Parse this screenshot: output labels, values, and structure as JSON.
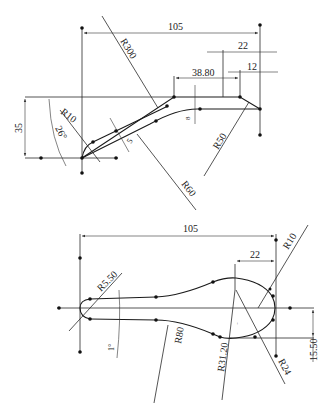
{
  "figure": {
    "type": "cad-sketch",
    "views": 2,
    "caption": "",
    "line_color": "#1a1a1a",
    "background": "#ffffff"
  },
  "top_view": {
    "dimensions": {
      "overall_length": "105",
      "right_offset_upper": "22",
      "right_offset_lower": "12",
      "flat_length": "38.80",
      "height": "35",
      "angle": "26°",
      "thickness_step": "8",
      "wall_thickness": "5",
      "radius_large": "R300",
      "radius_corner": "R10",
      "radius_lower_arc": "R60",
      "radius_right": "R50"
    }
  },
  "bottom_view": {
    "dimensions": {
      "overall_length": "105",
      "head_offset": "22",
      "radius_tip": "R10",
      "radius_end": "R5.50",
      "angle": "1°",
      "radius_shank": "R80",
      "radius_head_lower": "R31.20",
      "radius_head": "R24",
      "center_offset": "15.50"
    }
  }
}
